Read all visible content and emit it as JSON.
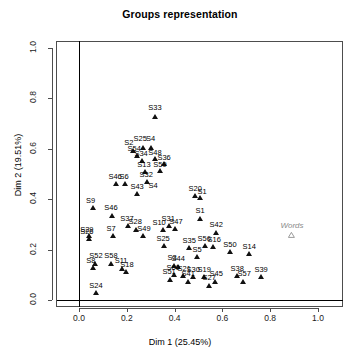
{
  "chart_data": {
    "type": "scatter",
    "title": "Groups representation",
    "xlabel": "Dim 1 (25.45%)",
    "ylabel": "Dim 2 (19.51%)",
    "xlim": [
      -0.09,
      1.09
    ],
    "ylim": [
      -0.03,
      1.055
    ],
    "xticks": [
      0.0,
      0.2,
      0.4,
      0.6,
      0.8,
      1.0
    ],
    "xticklabels": [
      "0.0",
      "0.2",
      "0.4",
      "0.6",
      "0.8",
      "1.0"
    ],
    "yticks": [
      0.0,
      0.2,
      0.4,
      0.6,
      0.8,
      1.0
    ],
    "yticklabels": [
      "0.0",
      "0.2",
      "0.4",
      "0.6",
      "0.8",
      "1.0"
    ],
    "grid": false,
    "legend": null,
    "reference_lines": [
      {
        "orientation": "vertical",
        "value": 0.0
      },
      {
        "orientation": "horizontal",
        "value": 0.0
      }
    ],
    "series": [
      {
        "name": "Groups",
        "marker": "filled-triangle",
        "color": "#111111",
        "points": [
          {
            "label": "S33",
            "x": 0.318,
            "y": 0.714
          },
          {
            "label": "S2",
            "x": 0.226,
            "y": 0.58
          },
          {
            "label": "S25",
            "x": 0.268,
            "y": 0.592
          },
          {
            "label": "S4",
            "x": 0.301,
            "y": 0.591
          },
          {
            "label": "S54",
            "x": 0.243,
            "y": 0.56
          },
          {
            "label": "S34",
            "x": 0.264,
            "y": 0.542
          },
          {
            "label": "S48",
            "x": 0.318,
            "y": 0.548
          },
          {
            "label": "S36",
            "x": 0.356,
            "y": 0.528
          },
          {
            "label": "S13",
            "x": 0.276,
            "y": 0.496
          },
          {
            "label": "S59",
            "x": 0.339,
            "y": 0.5
          },
          {
            "label": "S32",
            "x": 0.285,
            "y": 0.457
          },
          {
            "label": "S46",
            "x": 0.155,
            "y": 0.449
          },
          {
            "label": "S6",
            "x": 0.193,
            "y": 0.449
          },
          {
            "label": "S43",
            "x": 0.243,
            "y": 0.409
          },
          {
            "label": "S20",
            "x": 0.486,
            "y": 0.401
          },
          {
            "label": "S61",
            "x": 0.507,
            "y": 0.395
          },
          {
            "label": "S9",
            "x": 0.059,
            "y": 0.353
          },
          {
            "label": "S46b",
            "x": 0.138,
            "y": 0.325
          },
          {
            "label": "S1",
            "x": 0.507,
            "y": 0.313
          },
          {
            "label": "S37",
            "x": 0.205,
            "y": 0.282
          },
          {
            "label": "S28",
            "x": 0.239,
            "y": 0.268
          },
          {
            "label": "S31",
            "x": 0.377,
            "y": 0.282
          },
          {
            "label": "S47",
            "x": 0.402,
            "y": 0.27
          },
          {
            "label": "S10",
            "x": 0.352,
            "y": 0.268
          },
          {
            "label": "S42",
            "x": 0.574,
            "y": 0.257
          },
          {
            "label": "S7",
            "x": 0.142,
            "y": 0.243
          },
          {
            "label": "S49",
            "x": 0.268,
            "y": 0.243
          },
          {
            "label": "S29",
            "x": 0.042,
            "y": 0.243
          },
          {
            "label": "S26",
            "x": 0.042,
            "y": 0.232
          },
          {
            "label": "S25b",
            "x": 0.356,
            "y": 0.205
          },
          {
            "label": "S35",
            "x": 0.461,
            "y": 0.197
          },
          {
            "label": "S56",
            "x": 0.528,
            "y": 0.205
          },
          {
            "label": "S16",
            "x": 0.562,
            "y": 0.201
          },
          {
            "label": "S50",
            "x": 0.632,
            "y": 0.18
          },
          {
            "label": "S14",
            "x": 0.712,
            "y": 0.172
          },
          {
            "label": "S5",
            "x": 0.494,
            "y": 0.159
          },
          {
            "label": "S52",
            "x": 0.067,
            "y": 0.134
          },
          {
            "label": "S58",
            "x": 0.134,
            "y": 0.134
          },
          {
            "label": "S8",
            "x": 0.059,
            "y": 0.117
          },
          {
            "label": "S11",
            "x": 0.18,
            "y": 0.113
          },
          {
            "label": "S18",
            "x": 0.197,
            "y": 0.101
          },
          {
            "label": "S3",
            "x": 0.398,
            "y": 0.126
          },
          {
            "label": "S44",
            "x": 0.415,
            "y": 0.122
          },
          {
            "label": "S60",
            "x": 0.398,
            "y": 0.088
          },
          {
            "label": "S21",
            "x": 0.436,
            "y": 0.084
          },
          {
            "label": "S30",
            "x": 0.478,
            "y": 0.08
          },
          {
            "label": "S19",
            "x": 0.524,
            "y": 0.08
          },
          {
            "label": "S51",
            "x": 0.381,
            "y": 0.071
          },
          {
            "label": "S41",
            "x": 0.457,
            "y": 0.063
          },
          {
            "label": "S45",
            "x": 0.57,
            "y": 0.063
          },
          {
            "label": "S27",
            "x": 0.545,
            "y": 0.046
          },
          {
            "label": "S38",
            "x": 0.662,
            "y": 0.084
          },
          {
            "label": "S57",
            "x": 0.687,
            "y": 0.063
          },
          {
            "label": "S39",
            "x": 0.762,
            "y": 0.08
          },
          {
            "label": "S24",
            "x": 0.071,
            "y": 0.017
          }
        ]
      },
      {
        "name": "Words",
        "marker": "hollow-triangle",
        "color": "#8c8c8c",
        "points": [
          {
            "label": "Words",
            "x": 0.891,
            "y": 0.247
          }
        ]
      }
    ]
  },
  "labels_display": [
    {
      "text": "S33",
      "x": 0.318,
      "y": 0.752,
      "anchor": "center"
    },
    {
      "text": "S2",
      "x": 0.209,
      "y": 0.615,
      "anchor": "center"
    },
    {
      "text": "S25",
      "x": 0.256,
      "y": 0.63,
      "anchor": "center"
    },
    {
      "text": "S4",
      "x": 0.3,
      "y": 0.63,
      "anchor": "center"
    },
    {
      "text": "S54",
      "x": 0.231,
      "y": 0.592,
      "anchor": "center"
    },
    {
      "text": "S34",
      "x": 0.26,
      "y": 0.572,
      "anchor": "center"
    },
    {
      "text": "S48",
      "x": 0.318,
      "y": 0.576,
      "anchor": "center"
    },
    {
      "text": "S36",
      "x": 0.356,
      "y": 0.556,
      "anchor": "center"
    },
    {
      "text": "S13",
      "x": 0.272,
      "y": 0.528,
      "anchor": "center"
    },
    {
      "text": "S59",
      "x": 0.339,
      "y": 0.528,
      "anchor": "center"
    },
    {
      "text": "S32",
      "x": 0.281,
      "y": 0.489,
      "anchor": "center"
    },
    {
      "text": "S46",
      "x": 0.151,
      "y": 0.481,
      "anchor": "center"
    },
    {
      "text": "S6",
      "x": 0.189,
      "y": 0.481,
      "anchor": "center"
    },
    {
      "text": "S43",
      "x": 0.243,
      "y": 0.441,
      "anchor": "center"
    },
    {
      "text": "S20",
      "x": 0.486,
      "y": 0.433,
      "anchor": "center"
    },
    {
      "text": "S1",
      "x": 0.515,
      "y": 0.421,
      "anchor": "center"
    },
    {
      "text": "S9",
      "x": 0.048,
      "y": 0.385,
      "anchor": "center"
    },
    {
      "text": "S46",
      "x": 0.134,
      "y": 0.357,
      "anchor": "center"
    },
    {
      "text": "S1",
      "x": 0.507,
      "y": 0.345,
      "anchor": "center"
    },
    {
      "text": "S37",
      "x": 0.201,
      "y": 0.313,
      "anchor": "center"
    },
    {
      "text": "S28",
      "x": 0.235,
      "y": 0.3,
      "anchor": "center"
    },
    {
      "text": "S31",
      "x": 0.373,
      "y": 0.313,
      "anchor": "center"
    },
    {
      "text": "S47",
      "x": 0.406,
      "y": 0.3,
      "anchor": "center"
    },
    {
      "text": "S10",
      "x": 0.335,
      "y": 0.296,
      "anchor": "center"
    },
    {
      "text": "S42",
      "x": 0.574,
      "y": 0.289,
      "anchor": "center"
    },
    {
      "text": "S7",
      "x": 0.134,
      "y": 0.274,
      "anchor": "center"
    },
    {
      "text": "S49",
      "x": 0.272,
      "y": 0.274,
      "anchor": "center"
    },
    {
      "text": "S29",
      "x": 0.033,
      "y": 0.27,
      "anchor": "center"
    },
    {
      "text": "S26",
      "x": 0.033,
      "y": 0.262,
      "anchor": "center"
    },
    {
      "text": "S25",
      "x": 0.352,
      "y": 0.236,
      "anchor": "center"
    },
    {
      "text": "S35",
      "x": 0.461,
      "y": 0.228,
      "anchor": "center"
    },
    {
      "text": "S56",
      "x": 0.524,
      "y": 0.236,
      "anchor": "center"
    },
    {
      "text": "S16",
      "x": 0.566,
      "y": 0.232,
      "anchor": "center"
    },
    {
      "text": "S50",
      "x": 0.632,
      "y": 0.211,
      "anchor": "center"
    },
    {
      "text": "S14",
      "x": 0.712,
      "y": 0.203,
      "anchor": "center"
    },
    {
      "text": "S5",
      "x": 0.494,
      "y": 0.19,
      "anchor": "center"
    },
    {
      "text": "S52",
      "x": 0.071,
      "y": 0.166,
      "anchor": "center"
    },
    {
      "text": "S58",
      "x": 0.134,
      "y": 0.166,
      "anchor": "center"
    },
    {
      "text": "S8",
      "x": 0.05,
      "y": 0.145,
      "anchor": "center"
    },
    {
      "text": "S11",
      "x": 0.176,
      "y": 0.145,
      "anchor": "center"
    },
    {
      "text": "S18",
      "x": 0.201,
      "y": 0.13,
      "anchor": "center"
    },
    {
      "text": "S3",
      "x": 0.39,
      "y": 0.157,
      "anchor": "center"
    },
    {
      "text": "S44",
      "x": 0.415,
      "y": 0.153,
      "anchor": "center"
    },
    {
      "text": "S60",
      "x": 0.394,
      "y": 0.118,
      "anchor": "center"
    },
    {
      "text": "S21",
      "x": 0.44,
      "y": 0.114,
      "anchor": "center"
    },
    {
      "text": "S30",
      "x": 0.478,
      "y": 0.11,
      "anchor": "center"
    },
    {
      "text": "S19",
      "x": 0.524,
      "y": 0.11,
      "anchor": "center"
    },
    {
      "text": "S51",
      "x": 0.377,
      "y": 0.102,
      "anchor": "center"
    },
    {
      "text": "S41",
      "x": 0.457,
      "y": 0.094,
      "anchor": "center"
    },
    {
      "text": "S45",
      "x": 0.574,
      "y": 0.094,
      "anchor": "center"
    },
    {
      "text": "S27",
      "x": 0.545,
      "y": 0.078,
      "anchor": "center"
    },
    {
      "text": "S38",
      "x": 0.662,
      "y": 0.114,
      "anchor": "center"
    },
    {
      "text": "S57",
      "x": 0.691,
      "y": 0.094,
      "anchor": "center"
    },
    {
      "text": "S39",
      "x": 0.762,
      "y": 0.11,
      "anchor": "center"
    },
    {
      "text": "S24",
      "x": 0.071,
      "y": 0.049,
      "anchor": "center"
    },
    {
      "text": "S4",
      "x": 0.31,
      "y": 0.445,
      "anchor": "center"
    }
  ],
  "words_label": "Words"
}
